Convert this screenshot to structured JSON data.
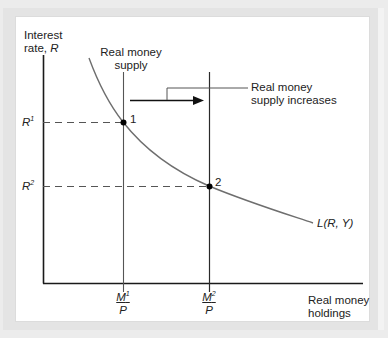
{
  "diagram": {
    "type": "economics-graph",
    "y_axis_label_line1": "Interest",
    "y_axis_label_line2": "rate, ",
    "y_axis_label_var": "R",
    "x_axis_label_line1": "Real money",
    "x_axis_label_line2": "holdings",
    "supply_label_line1": "Real money",
    "supply_label_line2": "supply",
    "shift_label_line1": "Real money",
    "shift_label_line2": "supply increases",
    "demand_curve_label": "L(R, Y)",
    "r1_var": "R",
    "r1_sup": "1",
    "r2_var": "R",
    "r2_sup": "2",
    "m1_num_var": "M",
    "m1_num_sup": "1",
    "m1_den": "P",
    "m2_num_var": "M",
    "m2_num_sup": "2",
    "m2_den": "P",
    "point1_label": "1",
    "point2_label": "2",
    "colors": {
      "axis": "#1a1a1a",
      "curve": "#6e6e6e",
      "supply_line": "#3a3a3a",
      "dashed": "#555555",
      "background_panel": "#ffffff",
      "frame": "#e4e4e4"
    },
    "equilibria": [
      {
        "id": "1",
        "interest_rate": "R1",
        "real_money_supply": "M1/P"
      },
      {
        "id": "2",
        "interest_rate": "R2",
        "real_money_supply": "M2/P"
      }
    ]
  }
}
